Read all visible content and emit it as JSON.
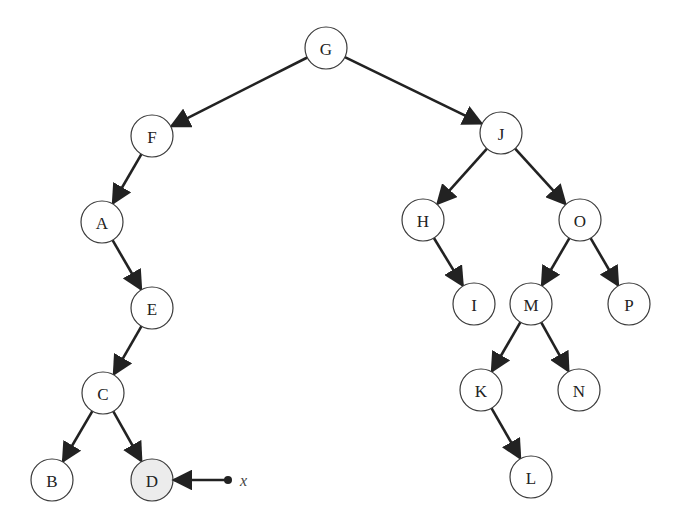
{
  "diagram": {
    "type": "binary-search-tree",
    "node_radius": 21,
    "colors": {
      "node_fill": "#ffffff",
      "highlight_fill": "#ececec",
      "stroke": "#3a3a3a",
      "edge": "#222222"
    },
    "nodes": [
      {
        "id": "G",
        "label": "G",
        "x": 326,
        "y": 48
      },
      {
        "id": "F",
        "label": "F",
        "x": 152,
        "y": 136
      },
      {
        "id": "J",
        "label": "J",
        "x": 501,
        "y": 133
      },
      {
        "id": "A",
        "label": "A",
        "x": 102,
        "y": 222
      },
      {
        "id": "H",
        "label": "H",
        "x": 423,
        "y": 220
      },
      {
        "id": "O",
        "label": "O",
        "x": 580,
        "y": 220
      },
      {
        "id": "E",
        "label": "E",
        "x": 152,
        "y": 308
      },
      {
        "id": "I",
        "label": "I",
        "x": 474,
        "y": 304
      },
      {
        "id": "M",
        "label": "M",
        "x": 531,
        "y": 304
      },
      {
        "id": "P",
        "label": "P",
        "x": 629,
        "y": 304
      },
      {
        "id": "C",
        "label": "C",
        "x": 103,
        "y": 393
      },
      {
        "id": "K",
        "label": "K",
        "x": 481,
        "y": 390
      },
      {
        "id": "N",
        "label": "N",
        "x": 579,
        "y": 390
      },
      {
        "id": "B",
        "label": "B",
        "x": 52,
        "y": 480
      },
      {
        "id": "D",
        "label": "D",
        "x": 152,
        "y": 480,
        "highlighted": true
      },
      {
        "id": "L",
        "label": "L",
        "x": 531,
        "y": 477
      }
    ],
    "edges": [
      {
        "from": "G",
        "to": "F"
      },
      {
        "from": "G",
        "to": "J"
      },
      {
        "from": "F",
        "to": "A"
      },
      {
        "from": "A",
        "to": "E"
      },
      {
        "from": "E",
        "to": "C"
      },
      {
        "from": "C",
        "to": "B"
      },
      {
        "from": "C",
        "to": "D"
      },
      {
        "from": "J",
        "to": "H"
      },
      {
        "from": "J",
        "to": "O"
      },
      {
        "from": "H",
        "to": "I"
      },
      {
        "from": "O",
        "to": "M"
      },
      {
        "from": "O",
        "to": "P"
      },
      {
        "from": "M",
        "to": "K"
      },
      {
        "from": "M",
        "to": "N"
      },
      {
        "from": "K",
        "to": "L"
      }
    ],
    "pointer": {
      "label": "x",
      "target": "D",
      "dot_x": 228,
      "dot_y": 480,
      "label_x": 240,
      "label_y": 480
    }
  }
}
